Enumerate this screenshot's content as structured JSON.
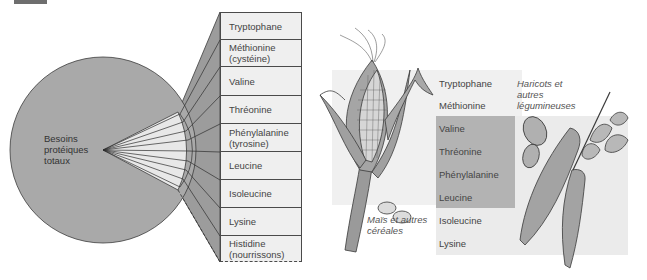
{
  "left_panel": {
    "circle_label": [
      "Besoins",
      "protéiques",
      "totaux"
    ],
    "amino_acids": [
      {
        "lines": [
          "Tryptophane"
        ],
        "top": 12,
        "height": 28
      },
      {
        "lines": [
          "Méthionine",
          "(cystéine)"
        ],
        "top": 40,
        "height": 27
      },
      {
        "lines": [
          "Valine"
        ],
        "top": 67,
        "height": 29
      },
      {
        "lines": [
          "Thréonine"
        ],
        "top": 96,
        "height": 28
      },
      {
        "lines": [
          "Phénylalanine",
          "(tyrosine)"
        ],
        "top": 124,
        "height": 28
      },
      {
        "lines": [
          "Leucine"
        ],
        "top": 152,
        "height": 28
      },
      {
        "lines": [
          "Isoleucine"
        ],
        "top": 180,
        "height": 28
      },
      {
        "lines": [
          "Lysine"
        ],
        "top": 208,
        "height": 28
      },
      {
        "lines": [
          "Histidine",
          "(nourrissons)"
        ],
        "top": 236,
        "height": 26,
        "dashed": true
      }
    ]
  },
  "right_panel": {
    "amino_acids": [
      {
        "label": "Tryptophane",
        "y": 84
      },
      {
        "label": "Méthionine",
        "y": 106
      },
      {
        "label": "Valine",
        "y": 129
      },
      {
        "label": "Thréonine",
        "y": 152
      },
      {
        "label": "Phénylalanine",
        "y": 175
      },
      {
        "label": "Leucine",
        "y": 198
      },
      {
        "label": "Isoleucine",
        "y": 221
      },
      {
        "label": "Lysine",
        "y": 244
      }
    ],
    "cereal_caption": [
      "Maïs et autres",
      "céréales"
    ],
    "legume_caption": [
      "Haricots et",
      "autres",
      "légumineuses"
    ]
  },
  "colors": {
    "circle_fill": "#a9a9a9",
    "fan_fill": "#e8e8e8",
    "trapezoid_fill": "#9c9c9c",
    "cell_fill": "#efefef",
    "cereal_region": "#efefef",
    "overlap_region": "#b3b3b3",
    "legume_region": "#e9e9e9",
    "stroke": "#3c3c3c"
  }
}
